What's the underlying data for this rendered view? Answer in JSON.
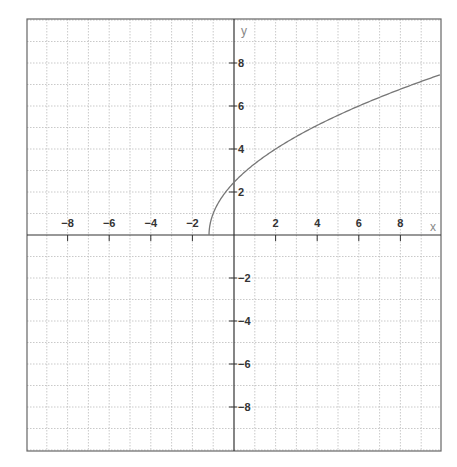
{
  "chart_data": {
    "type": "line",
    "title": "",
    "xlabel": "x",
    "ylabel": "y",
    "xlim": [
      -10,
      10
    ],
    "ylim": [
      -10,
      10
    ],
    "grid": true,
    "grid_step": 1,
    "legend": null,
    "x_ticks": [
      -8,
      -6,
      -4,
      -2,
      2,
      4,
      6,
      8
    ],
    "y_ticks": [
      8,
      6,
      4,
      2,
      -2,
      -4,
      -6,
      -8
    ],
    "x_tick_labels": [
      "−8",
      "−6",
      "−4",
      "−2",
      "2",
      "4",
      "6",
      "8"
    ],
    "y_tick_labels": [
      "8",
      "6",
      "4",
      "2",
      "−2",
      "−4",
      "−6",
      "−8"
    ],
    "series": [
      {
        "name": "curve",
        "description": "square-root curve opening right, starting on x-axis near x=-1.2",
        "x": [
          -1.2,
          -1.0,
          -0.5,
          0,
          0.5,
          1,
          2,
          3,
          4,
          5,
          6,
          7,
          8,
          9,
          9.9
        ],
        "y": [
          0.0,
          1.0,
          1.87,
          2.45,
          2.92,
          3.32,
          4.0,
          4.58,
          5.1,
          5.57,
          6.0,
          6.4,
          6.78,
          7.14,
          7.45
        ]
      }
    ]
  },
  "labels": {
    "x_axis_name": "x",
    "y_axis_name": "y"
  },
  "colors": {
    "frame": "#666666",
    "axis": "#333333",
    "grid": "#bbbbbb",
    "curve": "#777777",
    "background": "#ffffff"
  }
}
